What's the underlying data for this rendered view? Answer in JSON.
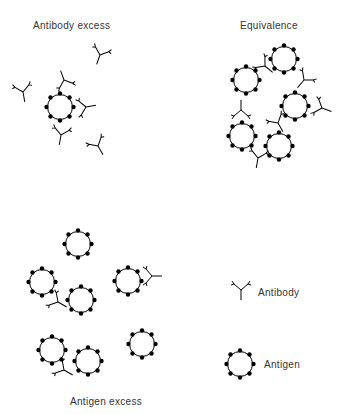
{
  "panels": {
    "antibody_excess": {
      "title": "Antibody excess"
    },
    "equivalence": {
      "title": "Equivalence"
    },
    "antigen_excess": {
      "title": "Antigen excess"
    }
  },
  "legend": {
    "antibody": {
      "label": "Antibody",
      "icon": "antibody-y-icon"
    },
    "antigen": {
      "label": "Antigen",
      "icon": "antigen-circle-icon"
    }
  },
  "colors": {
    "stroke": "#000000",
    "text": "#333333",
    "background": "#ffffff"
  }
}
